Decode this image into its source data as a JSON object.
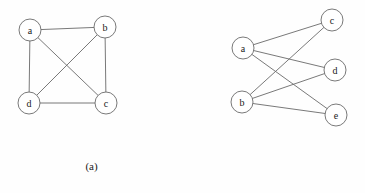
{
  "figure": {
    "background_color": "#fefefe",
    "stroke_color": "#6a6a6a",
    "node_fill_color": "#ffffff",
    "label_color": "#1a1a1a",
    "node_radius": 11
  },
  "panels": [
    {
      "id": "a",
      "caption": "(a)",
      "graph_type": "complete-graph",
      "nodes": [
        {
          "id": "a",
          "label": "a",
          "cx": 30,
          "cy": 30
        },
        {
          "id": "b",
          "label": "b",
          "cx": 105,
          "cy": 27
        },
        {
          "id": "c",
          "label": "c",
          "cx": 106,
          "cy": 103
        },
        {
          "id": "d",
          "label": "d",
          "cx": 29,
          "cy": 103
        }
      ],
      "edges": [
        {
          "from": "a",
          "to": "b"
        },
        {
          "from": "b",
          "to": "c"
        },
        {
          "from": "c",
          "to": "d"
        },
        {
          "from": "d",
          "to": "a"
        },
        {
          "from": "a",
          "to": "c"
        },
        {
          "from": "b",
          "to": "d"
        }
      ]
    },
    {
      "id": "b",
      "caption": "(b)",
      "graph_type": "complete-bipartite-graph",
      "nodes": [
        {
          "id": "a",
          "label": "a",
          "cx": 60,
          "cy": 48
        },
        {
          "id": "b",
          "label": "b",
          "cx": 59,
          "cy": 102
        },
        {
          "id": "c",
          "label": "c",
          "cx": 149,
          "cy": 20
        },
        {
          "id": "d",
          "label": "d",
          "cx": 152,
          "cy": 70
        },
        {
          "id": "e",
          "label": "e",
          "cx": 153,
          "cy": 115
        }
      ],
      "edges": [
        {
          "from": "a",
          "to": "c"
        },
        {
          "from": "a",
          "to": "d"
        },
        {
          "from": "a",
          "to": "e"
        },
        {
          "from": "b",
          "to": "c"
        },
        {
          "from": "b",
          "to": "d"
        },
        {
          "from": "b",
          "to": "e"
        }
      ]
    }
  ]
}
